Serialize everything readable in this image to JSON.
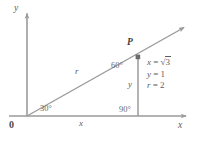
{
  "figure": {
    "type": "coordinate-plane-diagram",
    "colors": {
      "line": "#9a9a9a",
      "text": "#5d5d5d",
      "point": "#6a6a6a",
      "background": "#ffffff"
    },
    "axes": {
      "y_axis_label": "y",
      "x_axis_label": "x",
      "origin_label": "0"
    },
    "point": {
      "label": "P"
    },
    "segment_labels": {
      "hypotenuse": "r",
      "horizontal_leg": "x",
      "vertical_leg": "y"
    },
    "angles": [
      {
        "name": "angle-at-origin",
        "label": "30°"
      },
      {
        "name": "angle-at-point-p",
        "label": "60°"
      },
      {
        "name": "right-angle-at-foot",
        "label": "90°"
      }
    ],
    "equations": [
      {
        "lhs": "x",
        "rel": "=",
        "rhs_prefix": "√",
        "rhs_radicand": "3",
        "rhs": "√3"
      },
      {
        "lhs": "y",
        "rel": "=",
        "rhs": "1"
      },
      {
        "lhs": "r",
        "rel": "=",
        "rhs": "2"
      }
    ]
  }
}
